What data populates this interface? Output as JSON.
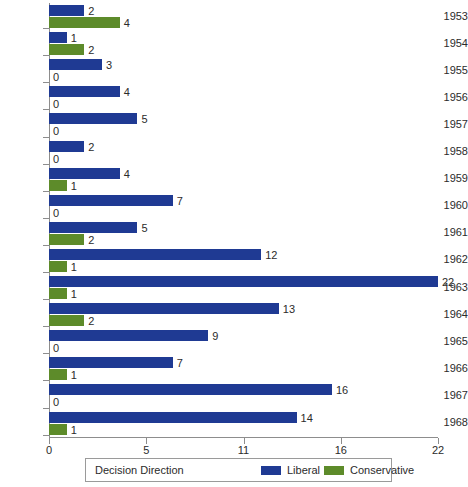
{
  "chart_data": {
    "type": "bar",
    "orientation": "horizontal",
    "title": "",
    "xlabel": "",
    "ylabel": "",
    "categories": [
      "1953",
      "1954",
      "1955",
      "1956",
      "1957",
      "1958",
      "1959",
      "1960",
      "1961",
      "1962",
      "1963",
      "1964",
      "1965",
      "1966",
      "1967",
      "1968"
    ],
    "series": [
      {
        "name": "Liberal",
        "color": "#1f3a93",
        "values": [
          2,
          1,
          3,
          4,
          5,
          2,
          4,
          7,
          5,
          12,
          22,
          13,
          9,
          7,
          16,
          14
        ]
      },
      {
        "name": "Conservative",
        "color": "#5d8b2a",
        "values": [
          4,
          2,
          0,
          0,
          0,
          0,
          1,
          0,
          2,
          1,
          1,
          2,
          0,
          1,
          0,
          1
        ]
      }
    ],
    "xticks": [
      "0",
      "5",
      "11",
      "16",
      "22"
    ],
    "xlim": [
      0,
      22
    ],
    "grid": false,
    "legend_position": "bottom",
    "legend_title": "Decision Direction"
  },
  "legend": {
    "title": "Decision Direction",
    "items": [
      {
        "label": "Liberal",
        "swatch": "lib"
      },
      {
        "label": "Conservative",
        "swatch": "con"
      }
    ]
  },
  "colors": {
    "liberal": "#1f3a93",
    "conservative": "#5d8b2a",
    "axis": "#8d8d8d",
    "text": "#2b2b2b",
    "background": "#ffffff"
  }
}
